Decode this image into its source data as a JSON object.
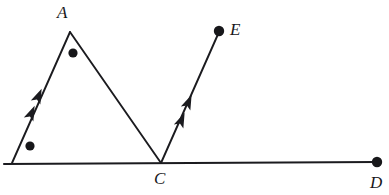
{
  "figure": {
    "background_color": "#ffffff",
    "stroke_color": "#1b1b1f",
    "width": 389,
    "height": 195,
    "labels": {
      "a": "A",
      "c": "C",
      "d": "D",
      "e": "E"
    },
    "points": [
      {
        "name": "B",
        "label": "",
        "x": 12,
        "y": 163,
        "marked": false
      },
      {
        "name": "A",
        "label": "A",
        "x": 70,
        "y": 32,
        "marked": false
      },
      {
        "name": "C",
        "label": "C",
        "x": 161,
        "y": 163,
        "marked": false
      },
      {
        "name": "D",
        "label": "D",
        "x": 377,
        "y": 162,
        "marked": true
      },
      {
        "name": "E",
        "label": "E",
        "x": 219,
        "y": 31,
        "marked": true
      }
    ],
    "segments": [
      {
        "name": "segment-BA",
        "from": "B",
        "to": "A",
        "x1": 12,
        "y1": 163,
        "x2": 70,
        "y2": 32,
        "arrow_marks": 2
      },
      {
        "name": "segment-AC",
        "from": "A",
        "to": "C",
        "x1": 70,
        "y1": 32,
        "x2": 161,
        "y2": 163,
        "arrow_marks": 0
      },
      {
        "name": "segment-CE",
        "from": "C",
        "to": "E",
        "x1": 161,
        "y1": 163,
        "x2": 219,
        "y2": 31,
        "arrow_marks": 2
      },
      {
        "name": "segment-BD",
        "from": "B",
        "to": "D",
        "x1": 4,
        "y1": 164,
        "x2": 377,
        "y2": 162,
        "arrow_marks": 0
      }
    ],
    "dots": [
      {
        "name": "dot-interior-near-A",
        "x": 73,
        "y": 53,
        "r": 4.6
      },
      {
        "name": "dot-interior-near-B",
        "x": 30,
        "y": 146,
        "r": 4.6
      },
      {
        "name": "dot-endpoint-E",
        "x": 219,
        "y": 31,
        "r": 5.2
      },
      {
        "name": "dot-endpoint-D",
        "x": 377,
        "y": 162,
        "r": 5.2
      }
    ],
    "arrow_marks": [
      {
        "name": "arrow-BA-upper",
        "x": 38,
        "y": 97,
        "angle": -66.1
      },
      {
        "name": "arrow-BA-lower",
        "x": 31,
        "y": 114,
        "angle": -66.1
      },
      {
        "name": "arrow-CE-upper",
        "x": 188,
        "y": 103,
        "angle": -66.3
      },
      {
        "name": "arrow-CE-lower",
        "x": 181,
        "y": 121,
        "angle": -66.3
      }
    ]
  }
}
